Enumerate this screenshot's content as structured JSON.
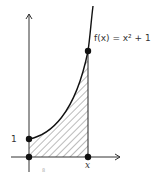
{
  "figure": {
    "function_label": "f(x) = x² + 1",
    "y_intercept_label": "1",
    "x_label": "x",
    "footnote_mark": "8"
  },
  "colors": {
    "stroke": "#111111",
    "hatch": "#555555",
    "text": "#333333"
  }
}
